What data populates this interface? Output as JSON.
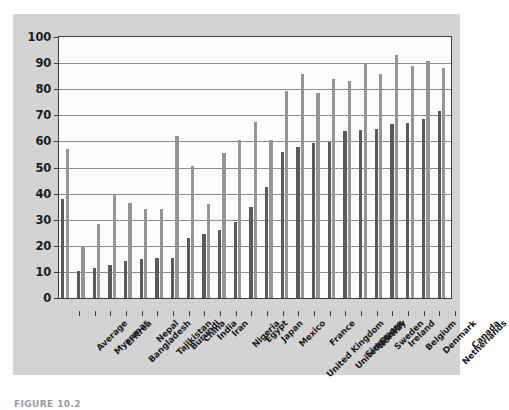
{
  "chart_data": {
    "type": "bar",
    "title": "",
    "xlabel": "",
    "ylabel": "",
    "ylim": [
      0,
      100
    ],
    "yticks": [
      0,
      10,
      20,
      30,
      40,
      50,
      60,
      70,
      80,
      90,
      100
    ],
    "grid": true,
    "legend": "none",
    "orientation": "vertical",
    "grouping": "grouped",
    "categories": [
      "Average",
      "Myanmar",
      "Eritrea",
      "Bangladesh",
      "Nepal",
      "Tajikistan",
      "Burundi",
      "China",
      "India",
      "Iran",
      "Nigeria",
      "Egypt",
      "Japan",
      "Mexico",
      "United Kingdom",
      "France",
      "United States",
      "Singapore",
      "Norway",
      "Sweden",
      "Ireland",
      "Belgium",
      "Denmark",
      "Netherlands",
      "Canada"
    ],
    "series": [
      {
        "name": "series-1",
        "color": "#5a5a5a",
        "values": [
          38.0,
          10.5,
          11.5,
          12.5,
          14.0,
          15.0,
          15.2,
          15.5,
          23.0,
          24.5,
          26.0,
          29.0,
          35.0,
          42.5,
          56.0,
          58.0,
          59.5,
          59.8,
          64.0,
          64.5,
          64.8,
          66.5,
          67.0,
          68.5,
          71.5
        ]
      },
      {
        "name": "series-2",
        "color": "#959595",
        "values": [
          57.0,
          20.0,
          28.5,
          39.5,
          36.5,
          34.0,
          34.0,
          62.0,
          50.5,
          36.0,
          55.5,
          60.5,
          67.5,
          60.5,
          79.5,
          86.0,
          78.5,
          84.0,
          83.0,
          89.5,
          86.0,
          93.0,
          89.0,
          91.0,
          88.0
        ]
      }
    ]
  },
  "caption": {
    "text": "FIGURE 10.2"
  },
  "colors": {
    "panel_background": "#d3d3d3",
    "plot_background": "#fdfdfd",
    "axis": "#3c3c3c",
    "gridline": "#8c8c8c",
    "series_1": "#5a5a5a",
    "series_2": "#959595"
  }
}
